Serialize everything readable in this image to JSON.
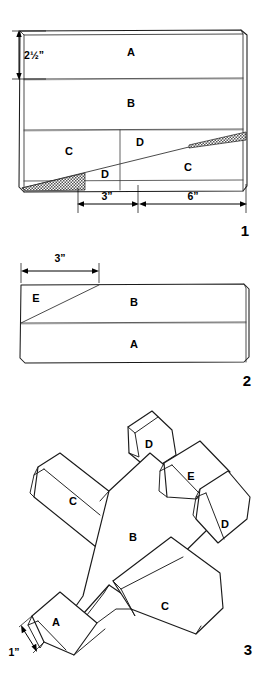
{
  "document": {
    "type": "cutting-diagram",
    "title": "Balsa glider cutting layout"
  },
  "figures": [
    {
      "number": "1",
      "name": "stock-block-cut-layout",
      "parts": [
        "A",
        "B",
        "C",
        "D",
        "D",
        "C"
      ],
      "labels": [
        {
          "text": "A",
          "x": 131,
          "y": 53
        },
        {
          "text": "B",
          "x": 131,
          "y": 104
        },
        {
          "text": "C",
          "x": 69,
          "y": 152
        },
        {
          "text": "D",
          "x": 140,
          "y": 143
        },
        {
          "text": "D",
          "x": 105,
          "y": 175
        },
        {
          "text": "C",
          "x": 188,
          "y": 168
        }
      ],
      "dimensions": [
        {
          "name": "height-dimension",
          "text": "2½”",
          "value": 2.5,
          "unit": "in",
          "orientation": "vertical"
        },
        {
          "name": "left-width-dimension",
          "text": "3”",
          "value": 3,
          "unit": "in",
          "orientation": "horizontal"
        },
        {
          "name": "right-width-dimension",
          "text": "6”",
          "value": 6,
          "unit": "in",
          "orientation": "horizontal"
        }
      ]
    },
    {
      "number": "2",
      "name": "second-block-cut-layout",
      "parts": [
        "E",
        "B",
        "A"
      ],
      "labels": [
        {
          "text": "E",
          "x": 36,
          "y": 299
        },
        {
          "text": "B",
          "x": 133,
          "y": 303
        },
        {
          "text": "A",
          "x": 133,
          "y": 350
        }
      ],
      "dimensions": [
        {
          "name": "taper-dimension",
          "text": "3”",
          "value": 3,
          "unit": "in",
          "orientation": "horizontal"
        }
      ]
    },
    {
      "number": "3",
      "name": "assembled-glider",
      "parts": [
        "D",
        "E",
        "C",
        "B",
        "D",
        "C",
        "A"
      ],
      "labels": [
        {
          "text": "D",
          "x": 148,
          "y": 455
        },
        {
          "text": "E",
          "x": 188,
          "y": 486
        },
        {
          "text": "C",
          "x": 72,
          "y": 512
        },
        {
          "text": "B",
          "x": 132,
          "y": 543
        },
        {
          "text": "D",
          "x": 224,
          "y": 530
        },
        {
          "text": "C",
          "x": 164,
          "y": 611
        },
        {
          "text": "A",
          "x": 56,
          "y": 648
        }
      ],
      "dimensions": [
        {
          "name": "nose-thickness-dimension",
          "text": "1”",
          "value": 1,
          "unit": "in",
          "orientation": "diagonal"
        }
      ]
    }
  ],
  "colors": {
    "ink": "#1a1a1a",
    "paper": "#ffffff",
    "hatch": "#808080"
  }
}
